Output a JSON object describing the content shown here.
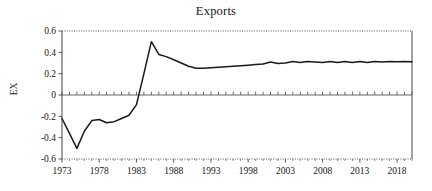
{
  "chart_data": {
    "type": "line",
    "title": "Exports",
    "xlabel": "",
    "ylabel": "EX",
    "xlim": [
      1973,
      2020
    ],
    "ylim": [
      -0.6,
      0.6
    ],
    "grid": false,
    "legend": null,
    "x_tick_labels": [
      "1973",
      "1978",
      "1983",
      "1988",
      "1993",
      "1998",
      "2003",
      "2008",
      "2013",
      "2018"
    ],
    "x_ticks": [
      1973,
      1978,
      1983,
      1988,
      1993,
      1998,
      2003,
      2008,
      2013,
      2018
    ],
    "y_tick_labels": [
      "0.6",
      "0.4",
      "0.2",
      "0",
      "-0.2",
      "-0.4",
      "-0.6"
    ],
    "y_ticks": [
      0.6,
      0.4,
      0.2,
      0,
      -0.2,
      -0.4,
      -0.6
    ],
    "minor_x_tick_interval": 1,
    "zero_line": 0,
    "line_color": "#1a1a1a",
    "series": [
      {
        "name": "EX",
        "x": [
          1973,
          1974,
          1975,
          1976,
          1977,
          1978,
          1979,
          1980,
          1981,
          1982,
          1983,
          1984,
          1985,
          1986,
          1987,
          1988,
          1989,
          1990,
          1991,
          1992,
          1993,
          1994,
          1995,
          1996,
          1997,
          1998,
          1999,
          2000,
          2001,
          2002,
          2003,
          2004,
          2005,
          2006,
          2007,
          2008,
          2009,
          2010,
          2011,
          2012,
          2013,
          2014,
          2015,
          2016,
          2017,
          2018,
          2019,
          2020
        ],
        "values": [
          -0.22,
          -0.36,
          -0.5,
          -0.34,
          -0.24,
          -0.23,
          -0.26,
          -0.25,
          -0.22,
          -0.19,
          -0.09,
          0.2,
          0.5,
          0.38,
          0.36,
          0.33,
          0.3,
          0.27,
          0.25,
          0.25,
          0.255,
          0.26,
          0.265,
          0.27,
          0.275,
          0.28,
          0.285,
          0.29,
          0.31,
          0.295,
          0.3,
          0.315,
          0.305,
          0.315,
          0.31,
          0.305,
          0.315,
          0.305,
          0.315,
          0.305,
          0.315,
          0.305,
          0.315,
          0.31,
          0.315,
          0.312,
          0.314,
          0.312
        ]
      }
    ]
  },
  "figure": {
    "background_color": "#ffffff",
    "frame_color": "#555555",
    "text_color": "#161616"
  }
}
